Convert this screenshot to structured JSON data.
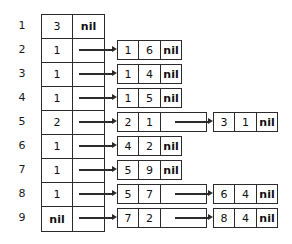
{
  "diagram": {
    "type": "linked-list-table",
    "colors": {
      "background": "#ffffff",
      "stroke": "#2b2b2b",
      "text": "#101010"
    },
    "nil_label": "nil",
    "row_labels": [
      "1",
      "2",
      "3",
      "4",
      "5",
      "6",
      "7",
      "8",
      "9"
    ],
    "rows": [
      {
        "index": "1",
        "head_key": "3",
        "head_ptr": "nil",
        "has_arrow": false,
        "nodes": []
      },
      {
        "index": "2",
        "head_key": "1",
        "head_ptr": "",
        "has_arrow": true,
        "nodes": [
          {
            "level": 1,
            "a": "1",
            "b": "6",
            "c": "nil",
            "has_arrow": false
          }
        ]
      },
      {
        "index": "3",
        "head_key": "1",
        "head_ptr": "",
        "has_arrow": true,
        "nodes": [
          {
            "level": 1,
            "a": "1",
            "b": "4",
            "c": "nil",
            "has_arrow": false
          }
        ]
      },
      {
        "index": "4",
        "head_key": "1",
        "head_ptr": "",
        "has_arrow": true,
        "nodes": [
          {
            "level": 1,
            "a": "1",
            "b": "5",
            "c": "nil",
            "has_arrow": false
          }
        ]
      },
      {
        "index": "5",
        "head_key": "2",
        "head_ptr": "",
        "has_arrow": true,
        "nodes": [
          {
            "level": 1,
            "a": "2",
            "b": "1",
            "c": "",
            "has_arrow": true
          },
          {
            "level": 2,
            "a": "3",
            "b": "1",
            "c": "nil",
            "has_arrow": false
          }
        ]
      },
      {
        "index": "6",
        "head_key": "1",
        "head_ptr": "",
        "has_arrow": true,
        "nodes": [
          {
            "level": 1,
            "a": "4",
            "b": "2",
            "c": "nil",
            "has_arrow": false
          }
        ]
      },
      {
        "index": "7",
        "head_key": "1",
        "head_ptr": "",
        "has_arrow": true,
        "nodes": [
          {
            "level": 1,
            "a": "5",
            "b": "9",
            "c": "nil",
            "has_arrow": false
          }
        ]
      },
      {
        "index": "8",
        "head_key": "1",
        "head_ptr": "",
        "has_arrow": true,
        "nodes": [
          {
            "level": 1,
            "a": "5",
            "b": "7",
            "c": "",
            "has_arrow": true
          },
          {
            "level": 2,
            "a": "6",
            "b": "4",
            "c": "nil",
            "has_arrow": false
          }
        ]
      },
      {
        "index": "9",
        "head_key": "nil",
        "head_ptr": "",
        "has_arrow": true,
        "nodes": [
          {
            "level": 1,
            "a": "7",
            "b": "2",
            "c": "",
            "has_arrow": true
          },
          {
            "level": 2,
            "a": "8",
            "b": "4",
            "c": "nil",
            "has_arrow": false
          }
        ]
      }
    ]
  }
}
